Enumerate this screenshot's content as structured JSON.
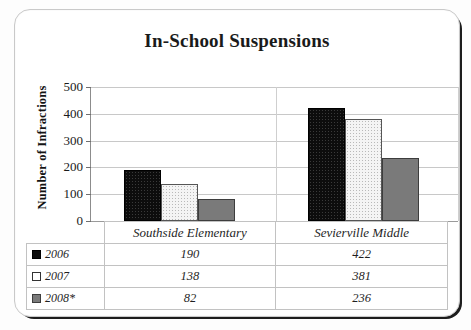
{
  "chart_data": {
    "type": "bar",
    "title": "In-School Suspensions",
    "xlabel": "",
    "ylabel": "Number of Infractions",
    "ylim": [
      0,
      500
    ],
    "yticks": [
      0,
      100,
      200,
      300,
      400,
      500
    ],
    "grid": true,
    "legend_position": "bottom-table",
    "categories": [
      "Southside Elementary",
      "Sevierville Middle"
    ],
    "series": [
      {
        "name": "2006",
        "values": [
          190,
          422
        ],
        "color": "#0d0d0d",
        "pattern": "dotted-dark"
      },
      {
        "name": "2007",
        "values": [
          138,
          381
        ],
        "color": "#f4f4f4",
        "pattern": "dotted-light"
      },
      {
        "name": "2008*",
        "values": [
          82,
          236
        ],
        "color": "#7a7a7a",
        "pattern": "solid-gray"
      }
    ]
  },
  "table": {
    "row_header_blank": "",
    "column_headers": [
      "Southside Elementary",
      "Sevierville Middle"
    ],
    "rows": [
      {
        "label": "2006",
        "swatch": "black-swatch-icon",
        "values": [
          "190",
          "422"
        ]
      },
      {
        "label": "2007",
        "swatch": "white-swatch-icon",
        "values": [
          "138",
          "381"
        ]
      },
      {
        "label": "2008*",
        "swatch": "gray-swatch-icon",
        "values": [
          "82",
          "236"
        ]
      }
    ]
  },
  "axis": {
    "y_tick_labels": [
      "500",
      "400",
      "300",
      "200",
      "100",
      "0"
    ]
  }
}
